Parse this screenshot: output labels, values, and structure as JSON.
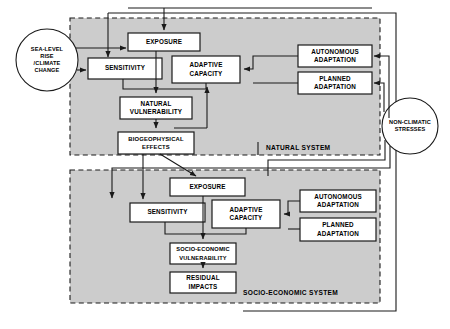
{
  "diagram": {
    "colors": {
      "system_fill": "#cccccc",
      "box_fill": "#ffffff",
      "stroke": "#1a1a1a",
      "background": "#ffffff"
    },
    "drivers": [
      {
        "id": "sea-level-rise-climate-change",
        "label": "SEA-LEVEL\nRISE\n/CLIMATE\nCHANGE",
        "shape": "circle"
      },
      {
        "id": "non-climatic-stresses",
        "label": "NON-CLIMATIC\nSTRESSES",
        "shape": "circle"
      }
    ],
    "systems": [
      {
        "id": "natural-system",
        "label": "NATURAL SYSTEM"
      },
      {
        "id": "socio-economic-system",
        "label": "SOCIO-ECONOMIC SYSTEM"
      }
    ],
    "natural_system_nodes": [
      {
        "id": "exposure-natural",
        "label": "EXPOSURE"
      },
      {
        "id": "sensitivity-natural",
        "label": "SENSITIVITY"
      },
      {
        "id": "adaptive-capacity-natural",
        "label": "ADAPTIVE\nCAPACITY"
      },
      {
        "id": "natural-vulnerability",
        "label": "NATURAL\nVULNERABILITY"
      },
      {
        "id": "biogeophysical-effects",
        "label": "BIOGEOPHYSICAL\nEFFECTS"
      },
      {
        "id": "autonomous-adaptation-natural",
        "label": "AUTONOMOUS\nADAPTATION"
      },
      {
        "id": "planned-adaptation-natural",
        "label": "PLANNED\nADAPTATION"
      }
    ],
    "socio_economic_system_nodes": [
      {
        "id": "exposure-socio",
        "label": "EXPOSURE"
      },
      {
        "id": "sensitivity-socio",
        "label": "SENSITIVITY"
      },
      {
        "id": "adaptive-capacity-socio",
        "label": "ADAPTIVE\nCAPACITY"
      },
      {
        "id": "socio-economic-vulnerability",
        "label": "SOCIO-ECONOMIC\nVULNERABILITY"
      },
      {
        "id": "residual-impacts",
        "label": "RESIDUAL\nIMPACTS"
      },
      {
        "id": "autonomous-adaptation-socio",
        "label": "AUTONOMOUS\nADAPTATION"
      },
      {
        "id": "planned-adaptation-socio",
        "label": "PLANNED\nADAPTATION"
      }
    ]
  }
}
